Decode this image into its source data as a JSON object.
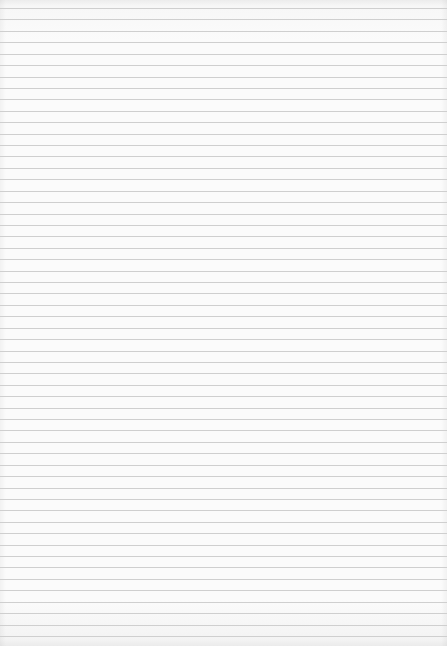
{
  "page": {
    "kind": "lined-paper",
    "rule_count": 56,
    "rule_color": "#cfcfcf",
    "paper_color": "#fbfbfb"
  }
}
